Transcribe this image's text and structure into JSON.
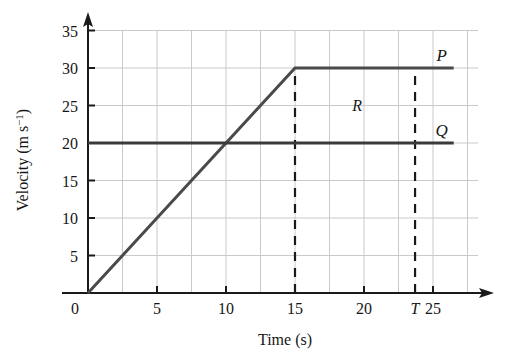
{
  "chart_data": {
    "type": "line",
    "title": "",
    "xlabel": "Time (s)",
    "ylabel": "Velocity (m s",
    "ylabel_sup": "−1",
    "ylabel_tail": ")",
    "xlim": [
      0,
      27.5
    ],
    "ylim": [
      0,
      35
    ],
    "xticks": [
      0,
      5,
      10,
      15,
      20,
      25
    ],
    "xtick_labels": [
      "0",
      "5",
      "10",
      "15",
      "20",
      "25"
    ],
    "yticks": [
      0,
      5,
      10,
      15,
      20,
      25,
      30,
      35
    ],
    "ytick_labels": [
      "0",
      "5",
      "10",
      "15",
      "20",
      "25",
      "30",
      "35"
    ],
    "grid": true,
    "grid_x_step": 2.5,
    "grid_y_step": 5,
    "legend": "inline-end-labels",
    "series": [
      {
        "name": "P",
        "label": "P",
        "points": [
          [
            0,
            0
          ],
          [
            15,
            30
          ],
          [
            26.5,
            30
          ]
        ],
        "color": "#4a4a4a"
      },
      {
        "name": "Q",
        "label": "Q",
        "points": [
          [
            0,
            20
          ],
          [
            26.5,
            20
          ]
        ],
        "color": "#3a3a3a"
      }
    ],
    "annotations": [
      {
        "name": "R",
        "text": "R",
        "x": 19.5,
        "y": 25
      },
      {
        "name": "T",
        "text": "T",
        "x": 23.7,
        "y": 0
      }
    ],
    "markers": [
      {
        "name": "dashed-15",
        "x": 15,
        "y_from": 0,
        "y_to": 30,
        "style": "dashed"
      },
      {
        "name": "dashed-T",
        "x": 23.7,
        "y_from": 0,
        "y_to": 30,
        "style": "dashed"
      }
    ]
  },
  "colors": {
    "grid": "#c9c9cf",
    "axis": "#1a1a1a",
    "series_p": "#4a4a4a",
    "series_q": "#3a3a3a",
    "dashed": "#1a1a1a"
  }
}
